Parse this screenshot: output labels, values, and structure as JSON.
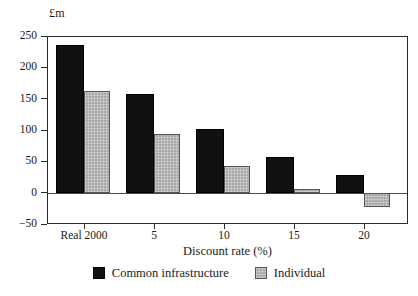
{
  "chart_data": {
    "type": "bar",
    "title": "",
    "subtitle": "",
    "xlabel": "Discount rate (%)",
    "ylabel": "£m",
    "unit_label": "£m",
    "categories": [
      "Real 2000",
      "5",
      "10",
      "15",
      "20"
    ],
    "series": [
      {
        "name": "Common infrastructure",
        "color": "#111111",
        "values": [
          235,
          158,
          102,
          57,
          28
        ]
      },
      {
        "name": "Individual",
        "color": "#a8a8a8",
        "values": [
          163,
          93,
          43,
          6,
          -23
        ]
      }
    ],
    "ylim": [
      -50,
      250
    ],
    "yticks": [
      250,
      200,
      150,
      100,
      50,
      0,
      -50
    ],
    "ytick_labels": [
      "250",
      "200",
      "150",
      "100",
      "50",
      "0",
      "−50"
    ],
    "grid": false,
    "zero_line": true,
    "legend_position": "bottom",
    "frame": "box"
  },
  "legend": {
    "entries": [
      {
        "label": "Common infrastructure",
        "swatch": "black-square-swatch"
      },
      {
        "label": "Individual",
        "swatch": "gray-square-swatch"
      }
    ]
  }
}
